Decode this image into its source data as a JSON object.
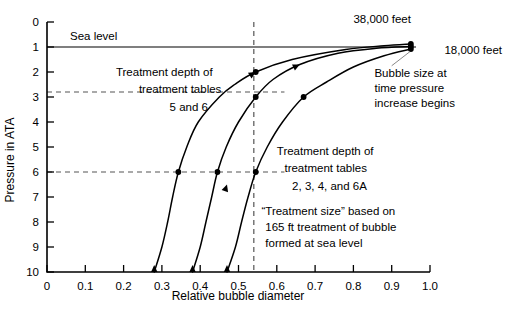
{
  "chart_data": {
    "type": "line",
    "title": "",
    "xlabel": "Relative bubble diameter",
    "ylabel": "Pressure in ATA",
    "xlim": [
      0,
      1.0
    ],
    "ylim": [
      0,
      10
    ],
    "y_inverted": true,
    "grid": false,
    "legend_position": "inline-right",
    "x_ticks": [
      "0",
      "0.1",
      "0.2",
      "0.3",
      "0.4",
      "0.5",
      "0.6",
      "0.7",
      "0.8",
      "0.9",
      "1.0"
    ],
    "x_tick_values": [
      0,
      0.1,
      0.2,
      0.3,
      0.4,
      0.5,
      0.6,
      0.7,
      0.8,
      0.9,
      1.0
    ],
    "y_ticks": [
      "0",
      "1",
      "2",
      "3",
      "4",
      "5",
      "6",
      "7",
      "8",
      "9",
      "10"
    ],
    "y_tick_values": [
      0,
      1,
      2,
      3,
      4,
      5,
      6,
      7,
      8,
      9,
      10
    ],
    "series": [
      {
        "name": "38,000 feet",
        "label": "38,000 feet",
        "points": [
          {
            "x": 0.28,
            "y": 10.0
          },
          {
            "x": 0.3,
            "y": 9.0
          },
          {
            "x": 0.315,
            "y": 8.0
          },
          {
            "x": 0.328,
            "y": 7.0
          },
          {
            "x": 0.343,
            "y": 6.0
          },
          {
            "x": 0.365,
            "y": 5.0
          },
          {
            "x": 0.395,
            "y": 4.0
          },
          {
            "x": 0.45,
            "y": 3.0
          },
          {
            "x": 0.49,
            "y": 2.5
          },
          {
            "x": 0.545,
            "y": 2.0
          },
          {
            "x": 0.64,
            "y": 1.5
          },
          {
            "x": 0.78,
            "y": 1.1
          },
          {
            "x": 0.88,
            "y": 0.95
          },
          {
            "x": 0.95,
            "y": 0.88
          }
        ],
        "markers": [
          {
            "x": 0.343,
            "y": 6.0,
            "note": "treatment depth tables 2,3,4,6A"
          },
          {
            "x": 0.545,
            "y": 2.0,
            "note": "at relative diameter 0.54"
          },
          {
            "x": 0.95,
            "y": 0.88,
            "note": "bubble size at time pressure increase begins"
          }
        ]
      },
      {
        "name": "unlabeled middle curve",
        "label": "",
        "points": [
          {
            "x": 0.38,
            "y": 10.0
          },
          {
            "x": 0.4,
            "y": 9.0
          },
          {
            "x": 0.415,
            "y": 8.0
          },
          {
            "x": 0.43,
            "y": 7.0
          },
          {
            "x": 0.445,
            "y": 6.0
          },
          {
            "x": 0.468,
            "y": 5.0
          },
          {
            "x": 0.5,
            "y": 4.0
          },
          {
            "x": 0.545,
            "y": 3.0
          },
          {
            "x": 0.59,
            "y": 2.3
          },
          {
            "x": 0.66,
            "y": 1.7
          },
          {
            "x": 0.76,
            "y": 1.25
          },
          {
            "x": 0.86,
            "y": 1.05
          },
          {
            "x": 0.95,
            "y": 0.98
          }
        ],
        "markers": [
          {
            "x": 0.445,
            "y": 6.0,
            "note": "treatment depth tables 2,3,4,6A"
          },
          {
            "x": 0.545,
            "y": 3.0,
            "note": "treatment depth tables 5 and 6"
          },
          {
            "x": 0.95,
            "y": 0.98,
            "note": "bubble size at time pressure increase begins"
          }
        ]
      },
      {
        "name": "18,000 feet",
        "label": "18,000 feet",
        "points": [
          {
            "x": 0.47,
            "y": 10.0
          },
          {
            "x": 0.492,
            "y": 9.0
          },
          {
            "x": 0.508,
            "y": 8.0
          },
          {
            "x": 0.525,
            "y": 7.0
          },
          {
            "x": 0.545,
            "y": 6.0
          },
          {
            "x": 0.575,
            "y": 5.0
          },
          {
            "x": 0.615,
            "y": 4.0
          },
          {
            "x": 0.67,
            "y": 3.0
          },
          {
            "x": 0.73,
            "y": 2.4
          },
          {
            "x": 0.8,
            "y": 1.8
          },
          {
            "x": 0.88,
            "y": 1.35
          },
          {
            "x": 0.95,
            "y": 1.08
          }
        ],
        "markers": [
          {
            "x": 0.545,
            "y": 6.0,
            "note": "treatment depth tables 2,3,4,6A"
          },
          {
            "x": 0.67,
            "y": 3.0,
            "note": "treatment depth tables 5 and 6"
          },
          {
            "x": 0.95,
            "y": 1.08,
            "note": "bubble size at time pressure increase begins"
          }
        ]
      }
    ],
    "reference_lines": [
      {
        "type": "horizontal",
        "value": 1.0,
        "label": "Sea level",
        "style": "solid"
      },
      {
        "type": "horizontal",
        "value": 2.8,
        "label": "Treatment depth of treatment tables 5 and 6",
        "style": "dashed"
      },
      {
        "type": "horizontal",
        "value": 6.0,
        "label": "Treatment depth of treatment tables 2, 3, 4, and 6A",
        "style": "dashed"
      },
      {
        "type": "vertical",
        "value": 0.54,
        "label": "",
        "style": "dashed"
      }
    ],
    "annotations": [
      {
        "text": "Sea level",
        "x": 0.06,
        "y": 0.7
      },
      {
        "text": "Treatment depth of",
        "x": 0.18,
        "y": 2.15
      },
      {
        "text": "treatment tables",
        "x": 0.24,
        "y": 2.85
      },
      {
        "text": "5 and 6",
        "x": 0.32,
        "y": 3.55
      },
      {
        "text": "Treatment depth of",
        "x": 0.6,
        "y": 5.3
      },
      {
        "text": "treatment tables",
        "x": 0.62,
        "y": 6.0
      },
      {
        "text": "2, 3, 4, and 6A",
        "x": 0.64,
        "y": 6.7
      },
      {
        "text": "“Treatment size” based on",
        "x": 0.56,
        "y": 7.7
      },
      {
        "text": "165 ft treatment of bubble",
        "x": 0.57,
        "y": 8.35
      },
      {
        "text": "formed at sea level",
        "x": 0.57,
        "y": 9.0
      },
      {
        "text": "38,000 feet",
        "x": 0.83,
        "y": 0.1
      },
      {
        "text": "18,000 feet",
        "x": 0.98,
        "y": 1.15
      },
      {
        "text": "Bubble size at",
        "x": 0.86,
        "y": 2.2
      },
      {
        "text": "time pressure",
        "x": 0.86,
        "y": 2.8
      },
      {
        "text": "increase begins",
        "x": 0.86,
        "y": 3.4
      }
    ]
  },
  "labels": {
    "y_axis_title": "Pressure in ATA",
    "x_axis_title": "Relative bubble diameter",
    "sea_level": "Sea level",
    "treat56_line1": "Treatment depth of",
    "treat56_line2": "treatment tables",
    "treat56_line3": "5 and 6",
    "treat2346a_line1": "Treatment depth of",
    "treat2346a_line2": "treatment tables",
    "treat2346a_line3": "2, 3, 4, and 6A",
    "tsize_line1": "“Treatment size” based on",
    "tsize_line2": "165 ft treatment of bubble",
    "tsize_line3": "formed at sea level",
    "alt_high": "38,000 feet",
    "alt_low": "18,000 feet",
    "bubble_line1": "Bubble size at",
    "bubble_line2": "time pressure",
    "bubble_line3": "increase begins"
  },
  "ticks": {
    "x": [
      "0",
      "0.1",
      "0.2",
      "0.3",
      "0.4",
      "0.5",
      "0.6",
      "0.7",
      "0.8",
      "0.9",
      "1.0"
    ],
    "y": [
      "0",
      "1",
      "2",
      "3",
      "4",
      "5",
      "6",
      "7",
      "8",
      "9",
      "10"
    ]
  },
  "colors": {
    "ink": "#000000",
    "dashed": "#555555",
    "background": "#ffffff"
  }
}
